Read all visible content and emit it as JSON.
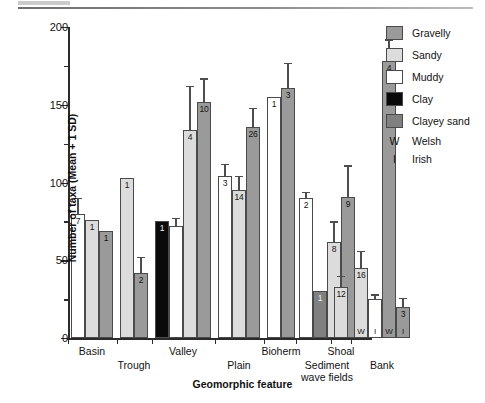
{
  "chart_data": {
    "type": "bar",
    "title": "",
    "xlabel": "Geomorphic feature",
    "ylabel": "Number of taxa (Mean + 1 SD)",
    "ylim": [
      0,
      200
    ],
    "yticks": [
      0,
      50,
      100,
      150,
      200
    ],
    "ytick_labels": [
      "0",
      "50",
      "100",
      "150",
      "200"
    ],
    "yminor_ticks": [
      25,
      75,
      125,
      175
    ],
    "grid": false,
    "legend_position": "top-right",
    "series": [
      {
        "name": "Gravelly",
        "color": "#9a9a9a"
      },
      {
        "name": "Sandy",
        "color": "#dcdcdc"
      },
      {
        "name": "Muddy",
        "color": "#ffffff"
      },
      {
        "name": "Clay",
        "color": "#0a0a0a"
      },
      {
        "name": "Clayey sand",
        "color": "#808080"
      }
    ],
    "code_legend": [
      {
        "letter": "W",
        "label": "Welsh"
      },
      {
        "letter": "I",
        "label": "Irish"
      }
    ],
    "categories": [
      "Basin",
      "Trough",
      "Valley",
      "Plain",
      "Bioherm",
      "Sediment wave fields",
      "Shoal",
      "Bank"
    ],
    "bars": [
      {
        "group": "Basin",
        "sediment": "Muddy",
        "value": 80,
        "sd": 10,
        "n": "7",
        "nation": ""
      },
      {
        "group": "Basin",
        "sediment": "Sandy",
        "value": 76,
        "sd": 0,
        "n": "1",
        "nation": ""
      },
      {
        "group": "Basin",
        "sediment": "Gravelly",
        "value": 69,
        "sd": 0,
        "n": "1",
        "nation": ""
      },
      {
        "group": "Trough",
        "sediment": "Sandy",
        "value": 103,
        "sd": 0,
        "n": "1",
        "nation": ""
      },
      {
        "group": "Trough",
        "sediment": "Gravelly",
        "value": 42,
        "sd": 10,
        "n": "2",
        "nation": ""
      },
      {
        "group": "Valley",
        "sediment": "Clay",
        "value": 75,
        "sd": 0,
        "n": "1",
        "nation": ""
      },
      {
        "group": "Valley",
        "sediment": "Muddy",
        "value": 72,
        "sd": 5,
        "n": "15",
        "nation": ""
      },
      {
        "group": "Valley",
        "sediment": "Sandy",
        "value": 134,
        "sd": 28,
        "n": "4",
        "nation": ""
      },
      {
        "group": "Valley",
        "sediment": "Gravelly",
        "value": 152,
        "sd": 15,
        "n": "10",
        "nation": ""
      },
      {
        "group": "Plain",
        "sediment": "Muddy",
        "value": 104,
        "sd": 8,
        "n": "3",
        "nation": ""
      },
      {
        "group": "Plain",
        "sediment": "Sandy",
        "value": 95,
        "sd": 9,
        "n": "14",
        "nation": ""
      },
      {
        "group": "Plain",
        "sediment": "Gravelly",
        "value": 136,
        "sd": 12,
        "n": "26",
        "nation": ""
      },
      {
        "group": "Bioherm",
        "sediment": "Muddy",
        "value": 155,
        "sd": 0,
        "n": "1",
        "nation": ""
      },
      {
        "group": "Bioherm",
        "sediment": "Gravelly",
        "value": 161,
        "sd": 16,
        "n": "3",
        "nation": ""
      },
      {
        "group": "Sediment wave fields",
        "sediment": "Muddy",
        "value": 90,
        "sd": 4,
        "n": "2",
        "nation": ""
      },
      {
        "group": "Sediment wave fields",
        "sediment": "Clayey sand",
        "value": 30,
        "sd": 0,
        "n": "1",
        "nation": ""
      },
      {
        "group": "Sediment wave fields",
        "sediment": "Sandy",
        "value": 62,
        "sd": 13,
        "n": "8",
        "nation": ""
      },
      {
        "group": "Sediment wave fields",
        "sediment": "Gravelly",
        "value": 91,
        "sd": 20,
        "n": "9",
        "nation": ""
      },
      {
        "group": "Shoal",
        "sediment": "Sandy",
        "value": 33,
        "sd": 7,
        "n": "12",
        "nation": ""
      },
      {
        "group": "Bank",
        "sediment": "Sandy",
        "value": 45,
        "sd": 11,
        "n": "16",
        "nation": "W"
      },
      {
        "group": "Bank",
        "sediment": "Muddy",
        "value": 25,
        "sd": 3,
        "n": "20",
        "nation": "I"
      },
      {
        "group": "Bank",
        "sediment": "Gravelly",
        "value": 178,
        "sd": 14,
        "n": "4",
        "nation": "W"
      },
      {
        "group": "Bank",
        "sediment": "Gravelly",
        "value": 20,
        "sd": 6,
        "n": "3",
        "nation": "I"
      }
    ]
  }
}
